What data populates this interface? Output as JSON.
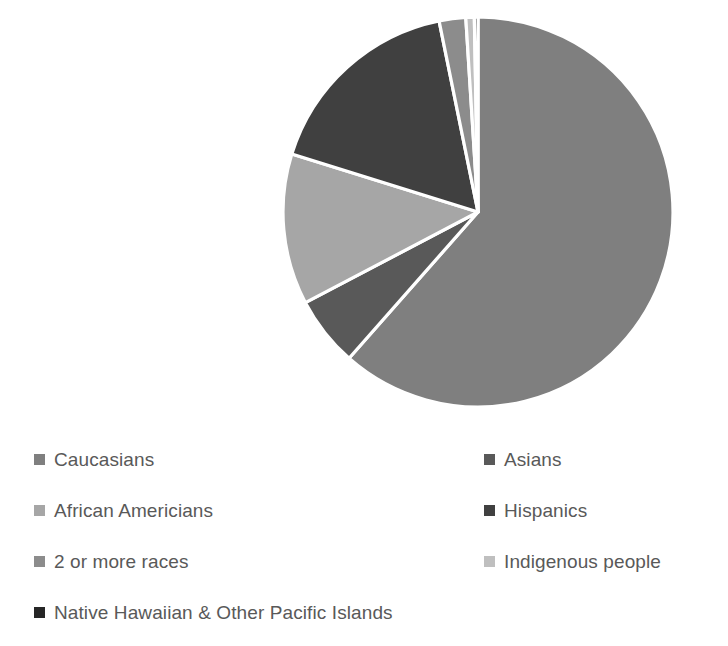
{
  "chart_data": {
    "type": "pie",
    "title": "",
    "subtitle": "",
    "xlabel": "",
    "ylabel": "",
    "grid": false,
    "legend_position": "bottom",
    "show_values": false,
    "categories": [
      "Caucasians",
      "Asians",
      "African Americians",
      "Hispanics",
      "2 or more races",
      "Indigenous people",
      "Native Hawaiian & Other Pacific Islands"
    ],
    "values": [
      61.5,
      5.8,
      12.5,
      17.0,
      2.2,
      0.7,
      0.3
    ],
    "colors": [
      "#7f7f7f",
      "#595959",
      "#a6a6a6",
      "#404040",
      "#8c8c8c",
      "#bfbfbf",
      "#262626"
    ],
    "slice_gap_color": "#ffffff",
    "start_angle_deg": 0,
    "direction": "clockwise",
    "center": {
      "x": 478,
      "y": 212
    },
    "radius": 195
  },
  "legend": {
    "items": [
      {
        "label": "Caucasians",
        "color": "#7f7f7f",
        "column": "left",
        "row": 1
      },
      {
        "label": "Asians",
        "color": "#595959",
        "column": "right",
        "row": 1
      },
      {
        "label": "African Americians",
        "color": "#a6a6a6",
        "column": "left",
        "row": 2
      },
      {
        "label": "Hispanics",
        "color": "#404040",
        "column": "right",
        "row": 2
      },
      {
        "label": "2 or more races",
        "color": "#8c8c8c",
        "column": "left",
        "row": 3
      },
      {
        "label": "Indigenous people",
        "color": "#bfbfbf",
        "column": "right",
        "row": 3
      },
      {
        "label": "Native Hawaiian & Other Pacific Islands",
        "color": "#262626",
        "column": "left",
        "row": 4
      }
    ]
  },
  "style": {
    "background": "#ffffff",
    "text_color": "#595959"
  }
}
